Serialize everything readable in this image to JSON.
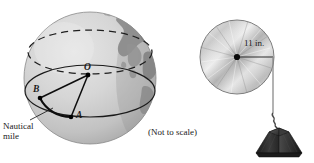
{
  "figure": {
    "caption_note": "(Not to scale)",
    "left_diagram": {
      "name": "earth-nautical-mile-diagram",
      "labels": {
        "center": "O",
        "point_b": "B",
        "point_a": "A",
        "arc_label_line1": "Nautical",
        "arc_label_line2": "mile",
        "arc_label": "Nautical\nmile"
      },
      "geometry": {
        "sphere_center_x": 90,
        "sphere_center_y": 78,
        "sphere_radius": 66,
        "point_O": [
          88,
          75
        ],
        "point_B": [
          40,
          98
        ],
        "point_A": [
          71,
          117
        ],
        "equator_ellipse_ry": 26,
        "dashed_ellipse_ry": 22
      },
      "colors": {
        "ocean_light": "#d9d9d9",
        "ocean_mid": "#c6c6c6",
        "land": "#8f8f8f",
        "land_dark": "#6e6e6e",
        "outline": "#4a4a4a",
        "line": "#111111"
      }
    },
    "right_diagram": {
      "name": "pulley-weight-diagram",
      "labels": {
        "radius": "11 in."
      },
      "geometry": {
        "disc_center_x": 237,
        "disc_center_y": 57,
        "disc_radius": 37,
        "rope_x": 273,
        "rope_top_y": 57,
        "rope_bottom_y": 118,
        "weight_center_x": 279,
        "weight_top_y": 122,
        "weight_bottom_y": 153
      },
      "colors": {
        "disc_light": "#fbfbfb",
        "disc_mid": "#c9c9c9",
        "disc_dark": "#8d8d8d",
        "disc_outline": "#6f6f6f",
        "hub": "#111111",
        "rope": "#7a7a7a",
        "weight_dark": "#2b2b2b",
        "weight_mid": "#3d3d3d",
        "weight_light": "#555555"
      }
    }
  }
}
